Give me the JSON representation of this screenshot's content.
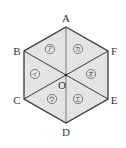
{
  "diagram": {
    "shape": "regular hexagon divided into 6 triangles",
    "colors": {
      "fill": "#e4e4e4",
      "edge": "#3a3a3a",
      "center_line": "#8a8a8a",
      "text": "#333333"
    },
    "center": {
      "label": "O",
      "x": 66,
      "y": 75
    },
    "vertices": [
      {
        "label": "A",
        "x": 66,
        "y": 27,
        "lx": 66,
        "ly": 22
      },
      {
        "label": "F",
        "x": 108,
        "y": 51,
        "lx": 114,
        "ly": 55
      },
      {
        "label": "E",
        "x": 108,
        "y": 99,
        "lx": 114,
        "ly": 103
      },
      {
        "label": "D",
        "x": 66,
        "y": 123,
        "lx": 66,
        "ly": 136
      },
      {
        "label": "C",
        "x": 24,
        "y": 99,
        "lx": 17,
        "ly": 103
      },
      {
        "label": "B",
        "x": 24,
        "y": 51,
        "lx": 17,
        "ly": 55
      }
    ],
    "regions": [
      {
        "label": "ア",
        "x": 50,
        "y": 49
      },
      {
        "label": "カ",
        "x": 78,
        "y": 49
      },
      {
        "label": "イ",
        "x": 35,
        "y": 74
      },
      {
        "label": "オ",
        "x": 91,
        "y": 74
      },
      {
        "label": "ウ",
        "x": 52,
        "y": 99
      },
      {
        "label": "エ",
        "x": 78,
        "y": 99
      }
    ]
  }
}
